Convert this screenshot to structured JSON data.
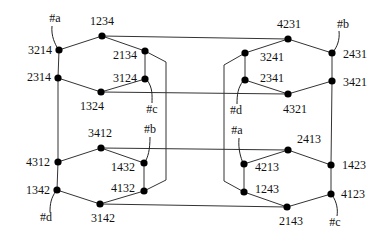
{
  "diagram": {
    "type": "permutation-graph",
    "nodes": [
      {
        "id": "1234",
        "label": "1234",
        "x": 102,
        "y": 36,
        "lx": 102,
        "ly": 25,
        "anchor": "middle"
      },
      {
        "id": "3214",
        "label": "3214",
        "x": 59,
        "y": 50,
        "lx": 52,
        "ly": 54,
        "anchor": "end"
      },
      {
        "id": "2314",
        "label": "2314",
        "x": 58,
        "y": 78,
        "lx": 51,
        "ly": 81,
        "anchor": "end"
      },
      {
        "id": "1324",
        "label": "1324",
        "x": 101,
        "y": 92,
        "lx": 92,
        "ly": 110,
        "anchor": "middle"
      },
      {
        "id": "2134",
        "label": "2134",
        "x": 145,
        "y": 51,
        "lx": 137,
        "ly": 59,
        "anchor": "end"
      },
      {
        "id": "3124",
        "label": "3124",
        "x": 145,
        "y": 79,
        "lx": 137,
        "ly": 82,
        "anchor": "end"
      },
      {
        "id": "4231",
        "label": "4231",
        "x": 288,
        "y": 39,
        "lx": 289,
        "ly": 28,
        "anchor": "middle"
      },
      {
        "id": "3241",
        "label": "3241",
        "x": 245,
        "y": 53,
        "lx": 260,
        "ly": 61,
        "anchor": "start"
      },
      {
        "id": "2341",
        "label": "2341",
        "x": 245,
        "y": 80,
        "lx": 260,
        "ly": 82,
        "anchor": "start"
      },
      {
        "id": "4321",
        "label": "4321",
        "x": 288,
        "y": 94,
        "lx": 295,
        "ly": 113,
        "anchor": "middle"
      },
      {
        "id": "2431",
        "label": "2431",
        "x": 332,
        "y": 53,
        "lx": 343,
        "ly": 58,
        "anchor": "start"
      },
      {
        "id": "3421",
        "label": "3421",
        "x": 332,
        "y": 81,
        "lx": 343,
        "ly": 86,
        "anchor": "start"
      },
      {
        "id": "3412",
        "label": "3412",
        "x": 101,
        "y": 148,
        "lx": 100,
        "ly": 137,
        "anchor": "middle"
      },
      {
        "id": "4312",
        "label": "4312",
        "x": 58,
        "y": 162,
        "lx": 50,
        "ly": 166,
        "anchor": "end"
      },
      {
        "id": "1342",
        "label": "1342",
        "x": 57,
        "y": 190,
        "lx": 50,
        "ly": 194,
        "anchor": "end"
      },
      {
        "id": "3142",
        "label": "3142",
        "x": 100,
        "y": 204,
        "lx": 103,
        "ly": 222,
        "anchor": "middle"
      },
      {
        "id": "1432",
        "label": "1432",
        "x": 144,
        "y": 163,
        "lx": 135,
        "ly": 171,
        "anchor": "end"
      },
      {
        "id": "4132",
        "label": "4132",
        "x": 144,
        "y": 191,
        "lx": 135,
        "ly": 192,
        "anchor": "end"
      },
      {
        "id": "2413",
        "label": "2413",
        "x": 288,
        "y": 150,
        "lx": 297,
        "ly": 143,
        "anchor": "start"
      },
      {
        "id": "4213",
        "label": "4213",
        "x": 244,
        "y": 164,
        "lx": 255,
        "ly": 171,
        "anchor": "start"
      },
      {
        "id": "1243",
        "label": "1243",
        "x": 244,
        "y": 192,
        "lx": 255,
        "ly": 193,
        "anchor": "start"
      },
      {
        "id": "2143",
        "label": "2143",
        "x": 287,
        "y": 207,
        "lx": 291,
        "ly": 225,
        "anchor": "middle"
      },
      {
        "id": "1423",
        "label": "1423",
        "x": 331,
        "y": 165,
        "lx": 342,
        "ly": 169,
        "anchor": "start"
      },
      {
        "id": "4123",
        "label": "4123",
        "x": 331,
        "y": 194,
        "lx": 341,
        "ly": 198,
        "anchor": "start"
      }
    ],
    "edges": [
      "M102,36 L59,50",
      "M59,50 L58,78",
      "M58,78 L101,92",
      "M101,92 L145,79",
      "M145,79 L145,51",
      "M145,51 L102,36",
      "M288,39 L245,53",
      "M245,53 L245,80",
      "M245,80 L288,94",
      "M288,94 L332,81",
      "M332,81 L332,53",
      "M332,53 L288,39",
      "M101,148 L58,162",
      "M58,162 L57,190",
      "M57,190 L100,204",
      "M100,204 L144,191",
      "M144,191 L144,163",
      "M144,163 L101,148",
      "M288,150 L244,164",
      "M244,164 L244,192",
      "M244,192 L287,207",
      "M287,207 L331,194",
      "M331,194 L331,165",
      "M331,165 L288,150",
      "M102,36 L288,39",
      "M101,92 L288,94",
      "M101,148 L288,150",
      "M100,204 L287,207",
      "M58,78 L58,162",
      "M332,81 L331,165",
      "M145,51 L166,62 L166,180 L144,191",
      "M245,53 L224,65 L224,181 L244,192"
    ],
    "tags": [
      {
        "label": "#a",
        "x": 55,
        "y": 22,
        "line": "M52,26 C51,36 55,44 58,49"
      },
      {
        "label": "#c",
        "x": 152,
        "y": 113,
        "line": "M147,80 C153,88 152,96 152,103"
      },
      {
        "label": "#b",
        "x": 150,
        "y": 133,
        "line": "M150,137 C150,150 148,157 145,162"
      },
      {
        "label": "#d",
        "x": 46,
        "y": 221,
        "line": "M56,191 C51,198 50,204 50,212"
      },
      {
        "label": "#b",
        "x": 343,
        "y": 28,
        "line": "M339,31 C340,40 337,47 333,52"
      },
      {
        "label": "#d",
        "x": 236,
        "y": 114,
        "line": "M243,81 C238,88 237,94 237,104"
      },
      {
        "label": "#a",
        "x": 237,
        "y": 134,
        "line": "M239,138 C238,150 241,158 243,163"
      },
      {
        "label": "#c",
        "x": 335,
        "y": 226,
        "line": "M332,195 C337,202 338,210 337,216"
      }
    ]
  }
}
